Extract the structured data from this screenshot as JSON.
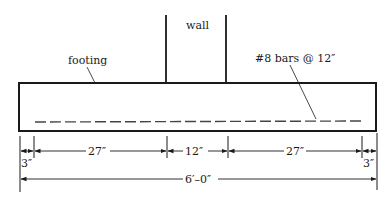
{
  "diagram": {
    "labels": {
      "wall": "wall",
      "footing": "footing",
      "reinforcement": "#8 bars @ 12″"
    },
    "dimensions": {
      "left_edge": "3″",
      "left_projection": "27″",
      "wall_width": "12″",
      "right_projection": "27″",
      "right_edge": "3″",
      "total_width": "6′–0″"
    },
    "colors": {
      "line": "#1a1a1a",
      "background": "#ffffff"
    }
  }
}
